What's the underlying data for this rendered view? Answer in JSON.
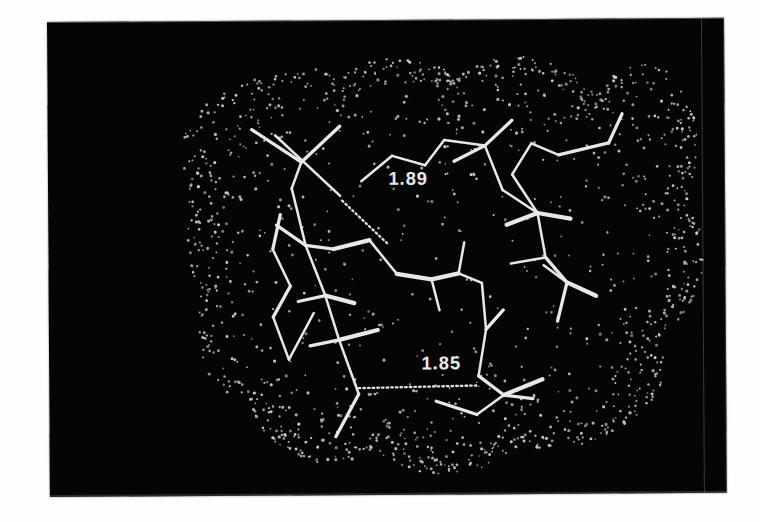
{
  "scene": {
    "title": "Molecular wireframe model with dotted van der Waals surface",
    "background_color": "#050505",
    "bond_color": "#e8e8e8",
    "surface_dot_color": "#cfcfcf",
    "label_color": "#e9e9e9"
  },
  "annotations": {
    "distances": [
      {
        "id": "hbond-1",
        "label": "1.89",
        "x": 352,
        "y": 170
      },
      {
        "id": "hbond-2",
        "label": "1.85",
        "x": 385,
        "y": 361
      }
    ]
  },
  "chart_data": {
    "type": "scatter",
    "xlabel": "",
    "ylabel": "",
    "annotations": [
      "1.89",
      "1.85"
    ],
    "surface_dot_count": 1350,
    "surface_outline": [
      [
        143,
        110
      ],
      [
        160,
        88
      ],
      [
        188,
        70
      ],
      [
        220,
        58
      ],
      [
        252,
        50
      ],
      [
        282,
        48
      ],
      [
        300,
        56
      ],
      [
        316,
        47
      ],
      [
        344,
        40
      ],
      [
        374,
        38
      ],
      [
        400,
        44
      ],
      [
        420,
        56
      ],
      [
        436,
        48
      ],
      [
        462,
        40
      ],
      [
        492,
        38
      ],
      [
        520,
        44
      ],
      [
        546,
        58
      ],
      [
        566,
        78
      ],
      [
        574,
        64
      ],
      [
        592,
        50
      ],
      [
        616,
        46
      ],
      [
        640,
        54
      ],
      [
        658,
        74
      ],
      [
        668,
        100
      ],
      [
        672,
        130
      ],
      [
        670,
        160
      ],
      [
        662,
        186
      ],
      [
        672,
        206
      ],
      [
        678,
        234
      ],
      [
        676,
        262
      ],
      [
        666,
        290
      ],
      [
        650,
        314
      ],
      [
        630,
        332
      ],
      [
        636,
        352
      ],
      [
        634,
        376
      ],
      [
        620,
        400
      ],
      [
        598,
        420
      ],
      [
        570,
        434
      ],
      [
        540,
        442
      ],
      [
        512,
        444
      ],
      [
        486,
        440
      ],
      [
        470,
        452
      ],
      [
        444,
        464
      ],
      [
        414,
        470
      ],
      [
        384,
        468
      ],
      [
        356,
        458
      ],
      [
        334,
        442
      ],
      [
        318,
        452
      ],
      [
        294,
        458
      ],
      [
        268,
        456
      ],
      [
        244,
        446
      ],
      [
        224,
        428
      ],
      [
        210,
        404
      ],
      [
        204,
        378
      ],
      [
        196,
        388
      ],
      [
        180,
        384
      ],
      [
        166,
        366
      ],
      [
        156,
        340
      ],
      [
        152,
        310
      ],
      [
        156,
        282
      ],
      [
        150,
        262
      ],
      [
        144,
        236
      ],
      [
        142,
        206
      ],
      [
        146,
        176
      ],
      [
        140,
        152
      ],
      [
        140,
        128
      ]
    ],
    "bonds": [
      {
        "x1": 235,
        "y1": 118,
        "x2": 302,
        "y2": 181,
        "w": "thin"
      },
      {
        "x1": 211,
        "y1": 112,
        "x2": 262,
        "y2": 146,
        "w": "med"
      },
      {
        "x1": 302,
        "y1": 109,
        "x2": 262,
        "y2": 146,
        "w": "med"
      },
      {
        "x1": 262,
        "y1": 146,
        "x2": 252,
        "y2": 173,
        "w": "thin"
      },
      {
        "x1": 252,
        "y1": 173,
        "x2": 266,
        "y2": 232,
        "w": "thin"
      },
      {
        "x1": 266,
        "y1": 232,
        "x2": 295,
        "y2": 236,
        "w": "med"
      },
      {
        "x1": 266,
        "y1": 232,
        "x2": 236,
        "y2": 211,
        "w": "med"
      },
      {
        "x1": 295,
        "y1": 236,
        "x2": 332,
        "y2": 227,
        "w": "thick"
      },
      {
        "x1": 266,
        "y1": 232,
        "x2": 286,
        "y2": 284,
        "w": "thin"
      },
      {
        "x1": 286,
        "y1": 284,
        "x2": 258,
        "y2": 290,
        "w": "med"
      },
      {
        "x1": 286,
        "y1": 284,
        "x2": 316,
        "y2": 292,
        "w": "thick"
      },
      {
        "x1": 286,
        "y1": 284,
        "x2": 300,
        "y2": 330,
        "w": "thin"
      },
      {
        "x1": 300,
        "y1": 330,
        "x2": 270,
        "y2": 336,
        "w": "med"
      },
      {
        "x1": 300,
        "y1": 330,
        "x2": 340,
        "y2": 320,
        "w": "thick"
      },
      {
        "x1": 300,
        "y1": 330,
        "x2": 320,
        "y2": 386,
        "w": "thin"
      },
      {
        "x1": 320,
        "y1": 386,
        "x2": 296,
        "y2": 430,
        "w": "med"
      },
      {
        "x1": 240,
        "y1": 200,
        "x2": 232,
        "y2": 236,
        "w": "med"
      },
      {
        "x1": 232,
        "y1": 236,
        "x2": 250,
        "y2": 274,
        "w": "thin"
      },
      {
        "x1": 250,
        "y1": 274,
        "x2": 232,
        "y2": 306,
        "w": "med"
      },
      {
        "x1": 232,
        "y1": 306,
        "x2": 248,
        "y2": 350,
        "w": "thin"
      },
      {
        "x1": 248,
        "y1": 350,
        "x2": 274,
        "y2": 302,
        "w": "thin"
      },
      {
        "x1": 332,
        "y1": 227,
        "x2": 360,
        "y2": 262,
        "w": "thin"
      },
      {
        "x1": 360,
        "y1": 262,
        "x2": 396,
        "y2": 268,
        "w": "thick"
      },
      {
        "x1": 396,
        "y1": 268,
        "x2": 424,
        "y2": 262,
        "w": "thick"
      },
      {
        "x1": 424,
        "y1": 262,
        "x2": 448,
        "y2": 272,
        "w": "thin"
      },
      {
        "x1": 448,
        "y1": 272,
        "x2": 452,
        "y2": 320,
        "w": "thin"
      },
      {
        "x1": 452,
        "y1": 320,
        "x2": 444,
        "y2": 368,
        "w": "thin"
      },
      {
        "x1": 444,
        "y1": 368,
        "x2": 470,
        "y2": 388,
        "w": "med"
      },
      {
        "x1": 470,
        "y1": 388,
        "x2": 442,
        "y2": 408,
        "w": "thin"
      },
      {
        "x1": 470,
        "y1": 388,
        "x2": 510,
        "y2": 372,
        "w": "thick"
      },
      {
        "x1": 470,
        "y1": 388,
        "x2": 500,
        "y2": 392,
        "w": "med"
      },
      {
        "x1": 442,
        "y1": 408,
        "x2": 400,
        "y2": 394,
        "w": "med"
      },
      {
        "x1": 324,
        "y1": 166,
        "x2": 356,
        "y2": 140,
        "w": "thin"
      },
      {
        "x1": 356,
        "y1": 140,
        "x2": 390,
        "y2": 150,
        "w": "thin"
      },
      {
        "x1": 390,
        "y1": 150,
        "x2": 410,
        "y2": 124,
        "w": "thin"
      },
      {
        "x1": 410,
        "y1": 124,
        "x2": 452,
        "y2": 130,
        "w": "thin"
      },
      {
        "x1": 452,
        "y1": 130,
        "x2": 420,
        "y2": 146,
        "w": "med"
      },
      {
        "x1": 452,
        "y1": 130,
        "x2": 480,
        "y2": 104,
        "w": "med"
      },
      {
        "x1": 452,
        "y1": 130,
        "x2": 470,
        "y2": 176,
        "w": "thin"
      },
      {
        "x1": 470,
        "y1": 176,
        "x2": 506,
        "y2": 200,
        "w": "thin"
      },
      {
        "x1": 506,
        "y1": 200,
        "x2": 480,
        "y2": 160,
        "w": "thin"
      },
      {
        "x1": 506,
        "y1": 200,
        "x2": 540,
        "y2": 206,
        "w": "thick"
      },
      {
        "x1": 506,
        "y1": 200,
        "x2": 474,
        "y2": 212,
        "w": "thick"
      },
      {
        "x1": 506,
        "y1": 200,
        "x2": 514,
        "y2": 246,
        "w": "thin"
      },
      {
        "x1": 514,
        "y1": 246,
        "x2": 536,
        "y2": 272,
        "w": "med"
      },
      {
        "x1": 536,
        "y1": 272,
        "x2": 566,
        "y2": 286,
        "w": "thick"
      },
      {
        "x1": 536,
        "y1": 272,
        "x2": 526,
        "y2": 312,
        "w": "med"
      },
      {
        "x1": 536,
        "y1": 272,
        "x2": 512,
        "y2": 254,
        "w": "thin"
      },
      {
        "x1": 514,
        "y1": 246,
        "x2": 478,
        "y2": 252,
        "w": "thin"
      },
      {
        "x1": 480,
        "y1": 160,
        "x2": 500,
        "y2": 128,
        "w": "thin"
      },
      {
        "x1": 500,
        "y1": 128,
        "x2": 528,
        "y2": 140,
        "w": "thin"
      },
      {
        "x1": 528,
        "y1": 140,
        "x2": 580,
        "y2": 128,
        "w": "med"
      },
      {
        "x1": 580,
        "y1": 128,
        "x2": 594,
        "y2": 98,
        "w": "med"
      },
      {
        "x1": 452,
        "y1": 320,
        "x2": 470,
        "y2": 300,
        "w": "med"
      },
      {
        "x1": 424,
        "y1": 262,
        "x2": 430,
        "y2": 230,
        "w": "thin"
      },
      {
        "x1": 396,
        "y1": 268,
        "x2": 404,
        "y2": 300,
        "w": "thin"
      }
    ],
    "hbonds": [
      {
        "x1": 304,
        "y1": 186,
        "x2": 352,
        "y2": 232,
        "label": "1.89"
      },
      {
        "x1": 320,
        "y1": 380,
        "x2": 442,
        "y2": 378,
        "label": "1.85"
      }
    ]
  }
}
